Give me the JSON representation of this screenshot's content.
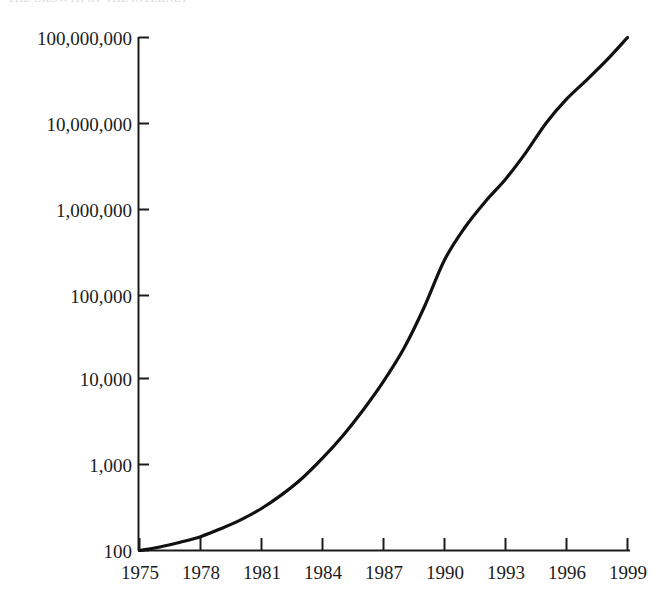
{
  "figure": {
    "cut_off_caption": "THE GROWTH OF THE INTERNET",
    "background_color": "#ffffff",
    "line_color": "#111111",
    "axis_color": "#1c1c1c",
    "text_color": "#1c1c1c"
  },
  "chart_data": {
    "type": "line",
    "title": "",
    "subtitle": "",
    "xlabel": "",
    "ylabel": "",
    "yscale": "log",
    "xscale": "linear",
    "grid": false,
    "legend": null,
    "legend_position": "none",
    "xlim": [
      1975,
      1999
    ],
    "ylim": [
      100,
      100000000
    ],
    "x_tick_labels": [
      "1975",
      "1978",
      "1981",
      "1984",
      "1987",
      "1990",
      "1993",
      "1996",
      "1999"
    ],
    "x_ticks": [
      1975,
      1978,
      1981,
      1984,
      1987,
      1990,
      1993,
      1996,
      1999
    ],
    "y_tick_labels": [
      "100,000,000",
      "10,000,000",
      "1,000,000",
      "100,000",
      "10,000",
      "1,000",
      "100"
    ],
    "y_ticks": [
      100000000,
      10000000,
      1000000,
      100000,
      10000,
      1000,
      100
    ],
    "series": [
      {
        "name": "Internet hosts",
        "x": [
          1975,
          1976,
          1977,
          1978,
          1979,
          1980,
          1981,
          1982,
          1983,
          1984,
          1985,
          1986,
          1987,
          1988,
          1989,
          1990,
          1991,
          1992,
          1993,
          1994,
          1995,
          1996,
          1997,
          1998,
          1999
        ],
        "values": [
          100,
          110,
          125,
          145,
          180,
          230,
          310,
          450,
          700,
          1200,
          2200,
          4400,
          9500,
          23000,
          70000,
          250000,
          600000,
          1200000,
          2200000,
          4500000,
          10000000,
          19000000,
          32000000,
          55000000,
          100000000
        ]
      }
    ]
  }
}
